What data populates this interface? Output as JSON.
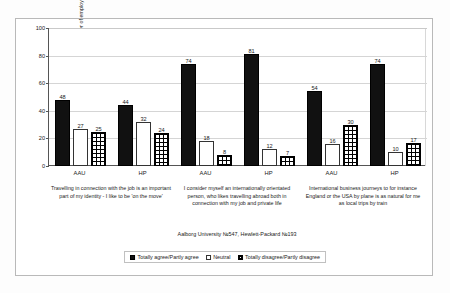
{
  "chart_data": {
    "type": "bar",
    "title": "",
    "subtitle": "",
    "xlabel": "",
    "ylabel": "% of the total number of employees",
    "ylim": [
      0,
      100
    ],
    "yticks": [
      0,
      20,
      40,
      60,
      80,
      100
    ],
    "grid": true,
    "legend_position": "bottom",
    "categories": [
      "AAU",
      "HP",
      "AAU",
      "HP",
      "AAU",
      "HP"
    ],
    "series": [
      {
        "name": "Totally agree/Partly agree",
        "swatch": "agree",
        "values": [
          48,
          44,
          74,
          81,
          54,
          74
        ]
      },
      {
        "name": "Neutral",
        "swatch": "neutral",
        "values": [
          27,
          32,
          18,
          12,
          16,
          10
        ]
      },
      {
        "name": "Totally disagree/Partly disagree",
        "swatch": "disagree",
        "values": [
          25,
          24,
          8,
          7,
          30,
          17
        ]
      }
    ],
    "group_captions": [
      "Travelling in connection with the job is an important part of my identity - I like to be 'on the move'",
      "I consider myself an internationally orientated person, who likes travelling abroad both in connection with my job and private life",
      "International business journeys to for instance England or the USA by plane is as natural for me as local trips by train"
    ],
    "source_note": "Aalborg University №547, Hewlett-Packard №193",
    "colors": {
      "agree": "#111111",
      "neutral": "#ffffff",
      "disagree": "#ffffff",
      "axis": "#555555",
      "grid": "#d5d5d5",
      "frame": "#b9b9b9"
    }
  }
}
